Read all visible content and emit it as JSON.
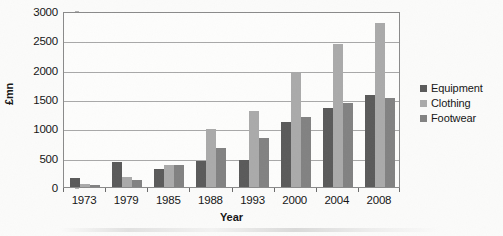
{
  "chart_data": {
    "type": "bar",
    "title": "",
    "xlabel": "Year",
    "ylabel": "£mn",
    "ylim": [
      0,
      3000
    ],
    "ytick_step": 500,
    "yticks": [
      0,
      500,
      1000,
      1500,
      2000,
      2500,
      3000
    ],
    "ytick_labels": [
      "0",
      "500",
      "1000",
      "1500",
      "2000",
      "2500",
      "3000"
    ],
    "grid": true,
    "legend_position": "right",
    "categories": [
      "1973",
      "1979",
      "1985",
      "1988",
      "1993",
      "2000",
      "2004",
      "2008"
    ],
    "series": [
      {
        "name": "Equipment",
        "color": "#5a5a5a",
        "values": [
          150,
          420,
          310,
          440,
          460,
          1100,
          1350,
          1570
        ]
      },
      {
        "name": "Clothing",
        "color": "#aaaaaa",
        "values": [
          50,
          170,
          370,
          990,
          1290,
          1950,
          2440,
          2790
        ]
      },
      {
        "name": "Footwear",
        "color": "#828282",
        "values": [
          30,
          120,
          375,
          660,
          830,
          1200,
          1440,
          1520
        ]
      }
    ]
  },
  "legend": {
    "items": [
      {
        "label": "Equipment",
        "color": "#5a5a5a"
      },
      {
        "label": "Clothing",
        "color": "#aaaaaa"
      },
      {
        "label": "Footwear",
        "color": "#828282"
      }
    ]
  },
  "axes": {
    "y_title": "£mn",
    "x_title": "Year"
  }
}
